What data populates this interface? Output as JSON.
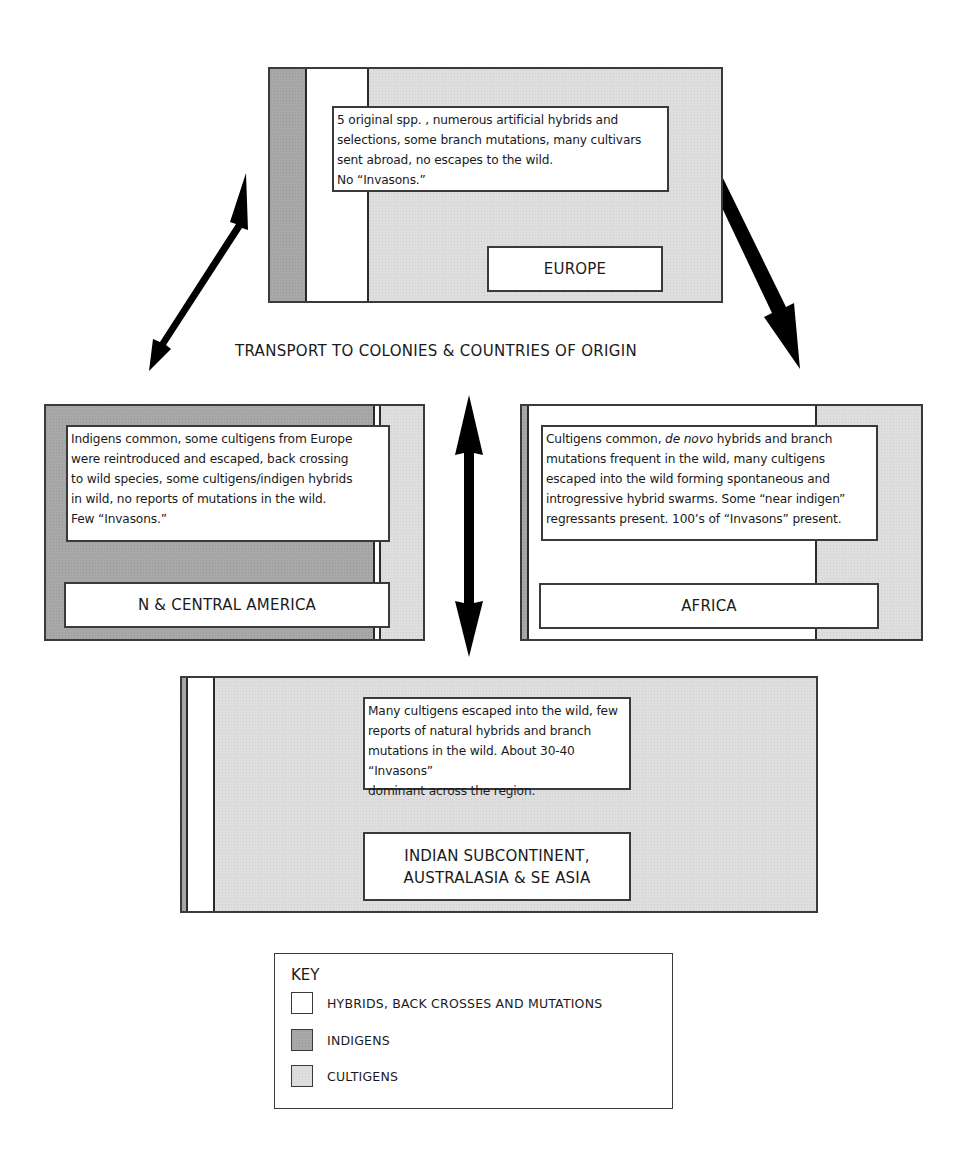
{
  "diagram": {
    "center_label": "TRANSPORT TO COLONIES & COUNTRIES OF ORIGIN",
    "regions": {
      "europe": {
        "label": "EUROPE",
        "description": "5 original spp. , numerous artificial hybrids and selections, some branch mutations, many cultivars sent abroad, no escapes to the wild. No “Invasons.”",
        "lines": [
          "5 original spp. , numerous artificial hybrids and",
          "selections, some branch mutations, many cultivars",
          "sent abroad, no escapes to the wild.",
          "No “Invasons.”"
        ],
        "composition": [
          "indigens",
          "hybrids",
          "cultigens"
        ]
      },
      "americas": {
        "label": "N & CENTRAL AMERICA",
        "description": "Indigens common, some cultigens from Europe were reintroduced and escaped, back crossing to wild species, some cultigens/indigen hybrids in wild, no reports of mutations in the wild. Few “Invasons.”",
        "lines": [
          "Indigens common, some cultigens from Europe",
          "were reintroduced and escaped, back crossing",
          "to wild species, some cultigens/indigen hybrids",
          "in wild, no reports of mutations in the wild.",
          "Few “Invasons.”"
        ],
        "composition": [
          "indigens",
          "hybrids",
          "cultigens"
        ]
      },
      "africa": {
        "label": "AFRICA",
        "description": "Cultigens common, de novo hybrids and branch mutations frequent in the wild, many cultigens escaped into the wild forming spontaneous and introgressive hybrid swarms. Some “near indigen” regressants present. 100's of “Invasons” present.",
        "line1_pre": "Cultigens common, ",
        "line1_italic": "de novo",
        "line1_post": " hybrids and branch",
        "lines": [
          "mutations frequent in the wild, many cultigens",
          "escaped into the wild forming spontaneous and",
          "introgressive hybrid swarms. Some “near indigen”",
          "regressants present. 100’s of “Invasons” present."
        ],
        "composition": [
          "indigens",
          "hybrids",
          "cultigens"
        ]
      },
      "asia": {
        "label_line1": "INDIAN SUBCONTINENT,",
        "label_line2": "AUSTRALASIA & SE ASIA",
        "description": "Many cultigens escaped into the wild, few reports of natural hybrids and branch mutations in the wild. About 30-40 “Invasons” dominant across the region.",
        "lines": [
          "Many cultigens escaped into the wild, few",
          "reports of natural hybrids and branch",
          "mutations in the wild. About 30-40 “Invasons”",
          "dominant across the region."
        ],
        "composition": [
          "indigens",
          "hybrids",
          "cultigens"
        ]
      }
    },
    "arrows": [
      {
        "name": "europe-americas",
        "type": "double",
        "from": "EUROPE",
        "to": "N & CENTRAL AMERICA"
      },
      {
        "name": "europe-africa",
        "type": "single",
        "from": "EUROPE",
        "to": "AFRICA"
      },
      {
        "name": "center-vertical",
        "type": "double",
        "from": "TRANSPORT",
        "to": "INDIAN SUBCONTINENT, AUSTRALASIA & SE ASIA"
      }
    ],
    "key": {
      "title": "KEY",
      "items": [
        {
          "label": "HYBRIDS, BACK CROSSES AND MUTATIONS",
          "color": "#ffffff"
        },
        {
          "label": "INDIGENS",
          "color": "#a8a8a8"
        },
        {
          "label": "CULTIGENS",
          "color": "#dedede"
        }
      ]
    },
    "colors": {
      "indigens": "#a8a8a8",
      "cultigens": "#dedede",
      "hybrids": "#ffffff",
      "border": "#3a3a3a",
      "arrow": "#000000"
    }
  }
}
